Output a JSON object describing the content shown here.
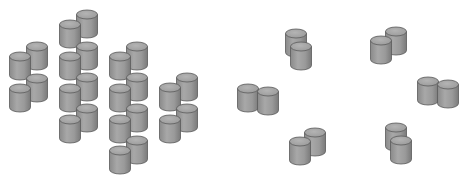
{
  "figure": {
    "colors": {
      "background": "#ffffff",
      "body_light": "#a6a6a6",
      "body_dark": "#7e7e7e",
      "top": "#9c9c9c",
      "top_highlight": "#b4b4b4",
      "outline": "#5a5a5a"
    },
    "cylinder": {
      "width": 21,
      "ellipse_height": 9,
      "body_height": 19
    },
    "left_arrangement": {
      "clusters": [
        {
          "name": "cluster-1",
          "cylinders": [
            [
              37,
              42
            ],
            [
              37,
              74
            ],
            [
              20,
              52
            ],
            [
              20,
              84
            ]
          ]
        },
        {
          "name": "cluster-2",
          "cylinders": [
            [
              87,
              10
            ],
            [
              87,
              42
            ],
            [
              87,
              73
            ],
            [
              87,
              104
            ],
            [
              70,
              20
            ],
            [
              70,
              52
            ],
            [
              70,
              84
            ],
            [
              70,
              115
            ]
          ]
        },
        {
          "name": "cluster-3",
          "cylinders": [
            [
              137,
              42
            ],
            [
              137,
              73
            ],
            [
              137,
              104
            ],
            [
              137,
              136
            ],
            [
              120,
              52
            ],
            [
              120,
              84
            ],
            [
              120,
              115
            ],
            [
              120,
              146
            ]
          ]
        },
        {
          "name": "cluster-4",
          "cylinders": [
            [
              187,
              73
            ],
            [
              187,
              104
            ],
            [
              170,
              83
            ],
            [
              170,
              115
            ]
          ]
        }
      ]
    },
    "right_arrangement": {
      "pairs": [
        {
          "name": "pair-top-left",
          "cylinders": [
            [
              296,
              29
            ],
            [
              301,
              42
            ]
          ]
        },
        {
          "name": "pair-top-right",
          "cylinders": [
            [
              396,
              27
            ],
            [
              381,
              36
            ]
          ]
        },
        {
          "name": "pair-left",
          "cylinders": [
            [
              248,
              84
            ],
            [
              268,
              87
            ]
          ]
        },
        {
          "name": "pair-right",
          "cylinders": [
            [
              428,
              77
            ],
            [
              448,
              80
            ]
          ]
        },
        {
          "name": "pair-bottom-left",
          "cylinders": [
            [
              315,
              128
            ],
            [
              300,
              137
            ]
          ]
        },
        {
          "name": "pair-bottom-right",
          "cylinders": [
            [
              396,
              123
            ],
            [
              401,
              136
            ]
          ]
        }
      ]
    }
  }
}
